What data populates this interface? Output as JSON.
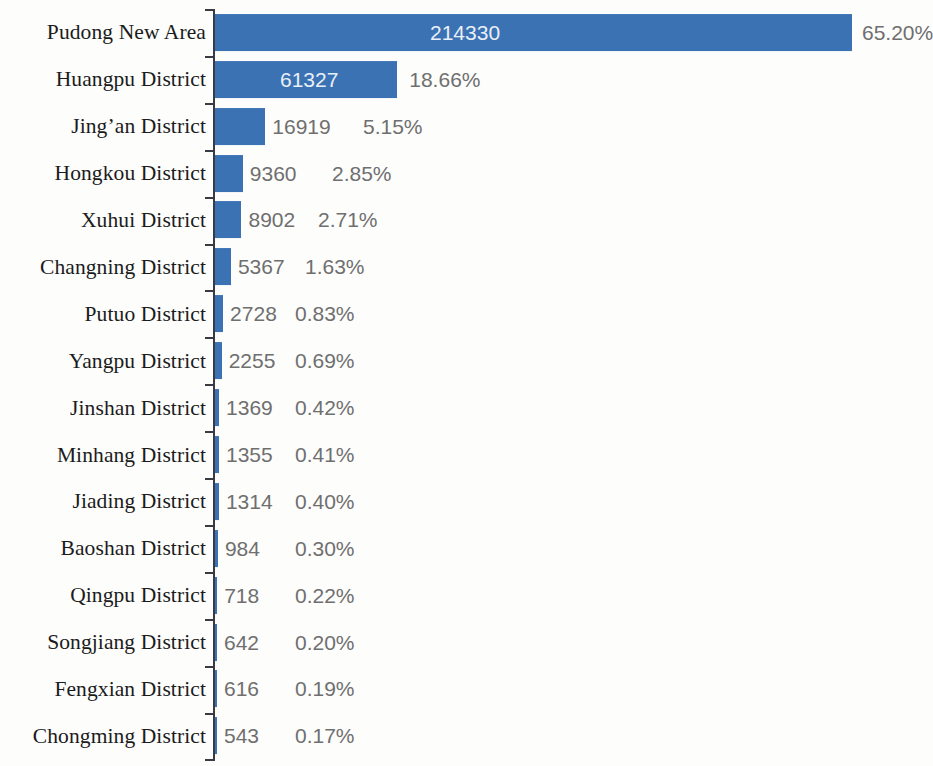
{
  "chart_data": {
    "type": "bar",
    "orientation": "horizontal",
    "title": "",
    "subtitle": "",
    "xlabel": "",
    "ylabel": "",
    "grid": false,
    "legend": "none",
    "xlim": [
      0,
      214330
    ],
    "categories": [
      "Pudong New Area",
      "Huangpu District",
      "Jing’an District",
      "Hongkou District",
      "Xuhui District",
      "Changning District",
      "Putuo District",
      "Yangpu District",
      "Jinshan District",
      "Minhang District",
      "Jiading District",
      "Baoshan District",
      "Qingpu District",
      "Songjiang District",
      "Fengxian District",
      "Chongming District"
    ],
    "values": [
      214330,
      61327,
      16919,
      9360,
      8902,
      5367,
      2728,
      2255,
      1369,
      1355,
      1314,
      984,
      718,
      642,
      616,
      543
    ],
    "value_labels": [
      "214330",
      "61327",
      "16919",
      "9360",
      "8902",
      "5367",
      "2728",
      "2255",
      "1369",
      "1355",
      "1314",
      "984",
      "718",
      "642",
      "616",
      "543"
    ],
    "percent_labels": [
      "65.20%",
      "18.66%",
      "5.15%",
      "2.85%",
      "2.71%",
      "1.63%",
      "0.83%",
      "0.69%",
      "0.42%",
      "0.41%",
      "0.40%",
      "0.30%",
      "0.22%",
      "0.20%",
      "0.19%",
      "0.17%"
    ],
    "percent_values": [
      65.2,
      18.66,
      5.15,
      2.85,
      2.71,
      1.63,
      0.83,
      0.69,
      0.42,
      0.41,
      0.4,
      0.3,
      0.22,
      0.2,
      0.19,
      0.17
    ],
    "series": [
      {
        "name": "Count",
        "values": [
          214330,
          61327,
          16919,
          9360,
          8902,
          5367,
          2728,
          2255,
          1369,
          1355,
          1314,
          984,
          718,
          642,
          616,
          543
        ]
      }
    ]
  },
  "style": {
    "bar_color": "#3b72b4",
    "inside_label_color": "#e9eff7",
    "outside_label_color": "#6f6f6f",
    "category_label_color": "#1b1b1b",
    "axis_color": "#3a3a44",
    "background_color": "#fdfdfc"
  }
}
